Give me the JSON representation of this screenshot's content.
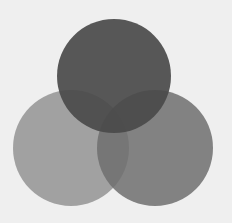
{
  "diagram": {
    "type": "venn",
    "set_count": 3,
    "sets": [
      {
        "name": "top-circle",
        "color": "#4a4a4a",
        "opacity": 0.92
      },
      {
        "name": "left-circle",
        "color": "#9a9a9a",
        "opacity": 0.92
      },
      {
        "name": "right-circle",
        "color": "#6e6e6e",
        "opacity": 0.85
      }
    ],
    "background": "#efefef"
  }
}
